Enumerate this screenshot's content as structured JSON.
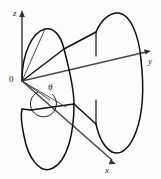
{
  "figure": {
    "kind": "3d-coordinate-diagram",
    "background_color": "#fdfdfd",
    "stroke_color": "#111111",
    "axis_color": "#4a4a4a",
    "labels": {
      "z_axis": "z",
      "y_axis": "y",
      "x_axis": "x",
      "origin": "0",
      "angle": "θ"
    },
    "axes": [
      {
        "name": "z",
        "label": "z",
        "direction": "up",
        "arrow": true
      },
      {
        "name": "y",
        "label": "y",
        "direction": "right",
        "arrow": true
      },
      {
        "name": "x",
        "label": "x",
        "direction": "down-right",
        "arrow": true
      }
    ],
    "annotations": [
      {
        "name": "theta-angle",
        "symbol": "θ",
        "type": "angle-arc"
      },
      {
        "name": "origin-marker",
        "symbol": "0",
        "type": "point-label"
      }
    ]
  }
}
